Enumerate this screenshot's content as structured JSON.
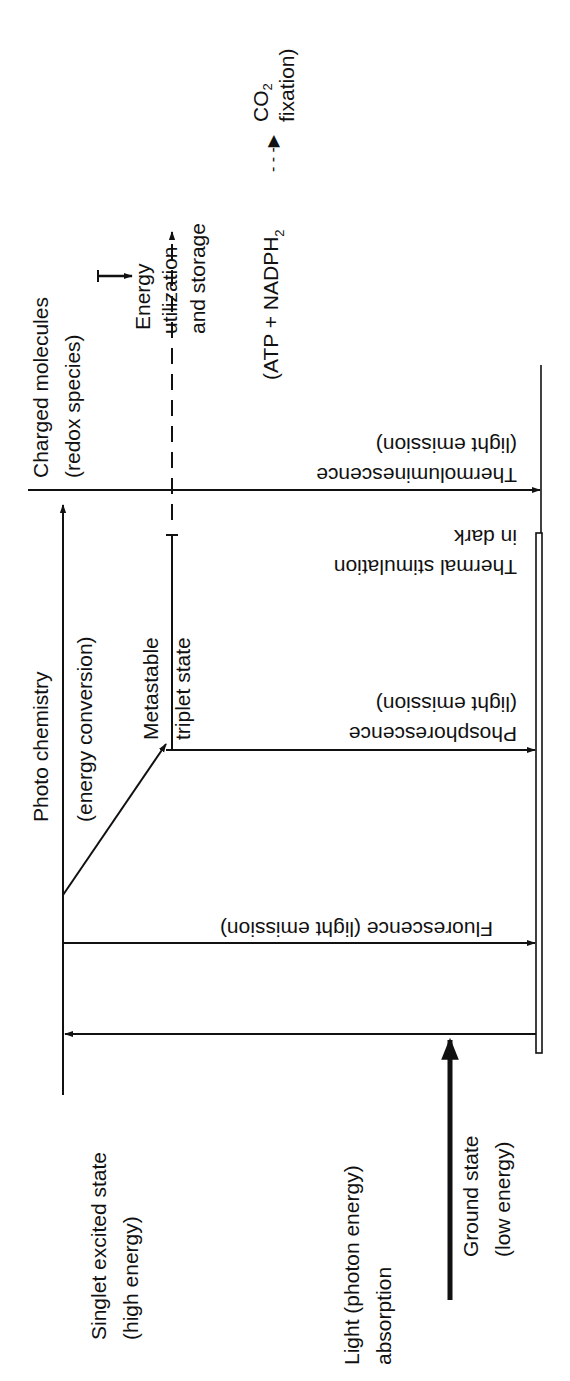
{
  "diagram": {
    "colors": {
      "ink": "#111111",
      "background": "#ffffff"
    },
    "states": {
      "singlet": {
        "line1": "Singlet excited state",
        "line2": "(high energy)"
      },
      "ground": {
        "line1": "Ground state",
        "line2": "(low energy)"
      },
      "triplet": {
        "line1": "Metastable",
        "line2": "triplet state"
      },
      "charged": {
        "line1": "Charged molecules",
        "line2": "(redox species)"
      }
    },
    "processes": {
      "light": {
        "line1": "Light (photon energy)",
        "line2": "absorption"
      },
      "fluorescence": {
        "line1": "Fluorescence (light emission)"
      },
      "photochemistry": {
        "line1": "Photo chemistry",
        "line2": "(energy conversion)"
      },
      "phosphorescence": {
        "line1": "Phosphorescence",
        "line2": "(light emission)"
      },
      "thermal": {
        "line1": "Thermal stimulation",
        "line2": "in dark"
      },
      "thermoluminescence": {
        "line1": "Thermoluminescence",
        "line2": "(light emission)"
      },
      "energy_use": {
        "line1": "Energy",
        "line2": "utilization",
        "line3": "and storage"
      },
      "products": {
        "line1": "(ATP + NADPH",
        "subscript": "2",
        "arrow": "- - -▶"
      },
      "co2": {
        "line1": "CO",
        "subscript": "2",
        "line2": "fixation)"
      }
    },
    "icons": {
      "arrowhead": "filled-triangle-arrowhead",
      "dashed_arrow": "dashed-arrow"
    }
  }
}
